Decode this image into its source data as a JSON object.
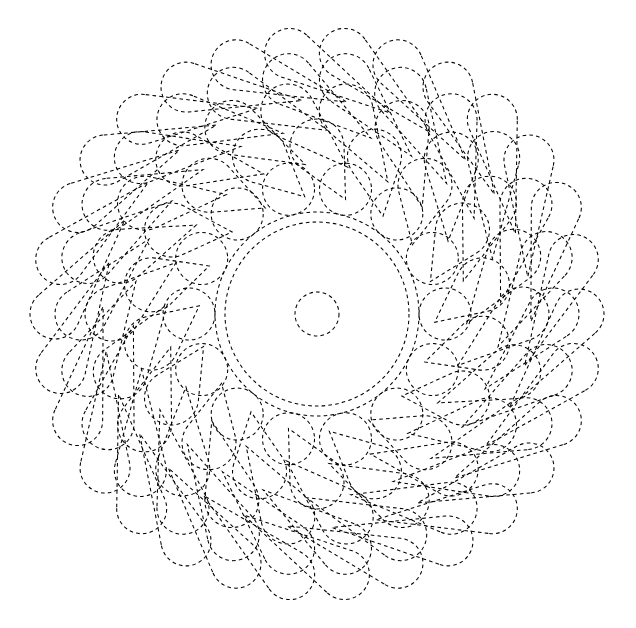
{
  "canvas": {
    "width": 636,
    "height": 628,
    "background": "#ffffff",
    "title": "Dashed Balloon Mandala"
  },
  "style": {
    "stroke": "#000000",
    "stroke_width": 1.05,
    "dash": "3.6 3.2",
    "fill": "none",
    "linecap": "butt"
  },
  "center": {
    "x": 317,
    "y": 314
  },
  "core": {
    "hub_circle": {
      "cx": 317,
      "cy": 314,
      "r": 22
    },
    "ring_circles": [
      {
        "cx": 317,
        "cy": 314,
        "r": 92
      },
      {
        "cx": 317,
        "cy": 314,
        "r": 102
      }
    ]
  },
  "chart_data": {
    "type": "scatter",
    "xlabel": "",
    "ylabel": "",
    "grid": false,
    "legend": null,
    "xlim": [
      27,
      607
    ],
    "ylim": [
      28,
      600
    ],
    "rings": [
      {
        "name": "ring-1",
        "count": 14,
        "orbit_radius": 128,
        "balloon_radius": 26,
        "stem_inner_radius": 102,
        "phase_deg": 12.857,
        "spiral_lean_deg": 0
      },
      {
        "name": "ring-2",
        "count": 18,
        "orbit_radius": 168,
        "balloon_radius": 27,
        "stem_inner_radius": 118,
        "phase_deg": 0,
        "spiral_lean_deg": 14
      },
      {
        "name": "ring-3",
        "count": 22,
        "orbit_radius": 205,
        "balloon_radius": 27,
        "stem_inner_radius": 150,
        "phase_deg": 8.18,
        "spiral_lean_deg": 20
      },
      {
        "name": "ring-4",
        "count": 26,
        "orbit_radius": 236,
        "balloon_radius": 26,
        "stem_inner_radius": 184,
        "phase_deg": 6.92,
        "spiral_lean_deg": 24
      },
      {
        "name": "ring-5",
        "count": 30,
        "orbit_radius": 262,
        "balloon_radius": 25,
        "stem_inner_radius": 214,
        "phase_deg": 6.0,
        "spiral_lean_deg": 26
      }
    ]
  }
}
